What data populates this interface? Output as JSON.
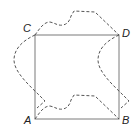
{
  "diagram": {
    "type": "geometry",
    "colors": {
      "square_stroke": "#7a7a7a",
      "dashed_stroke": "#555555",
      "label": "#222222",
      "background": "#ffffff"
    },
    "vertices": {
      "A": {
        "label": "A",
        "x": 35,
        "y": 119
      },
      "B": {
        "label": "B",
        "x": 119,
        "y": 119
      },
      "C": {
        "label": "C",
        "x": 35,
        "y": 35
      },
      "D": {
        "label": "D",
        "x": 119,
        "y": 35
      }
    },
    "labels": [
      {
        "name": "A",
        "text": "A",
        "x": 24,
        "y": 124
      },
      {
        "name": "B",
        "text": "B",
        "x": 122,
        "y": 124
      },
      {
        "name": "C",
        "text": "C",
        "x": 23,
        "y": 32
      },
      {
        "name": "D",
        "text": "D",
        "x": 122,
        "y": 37
      }
    ],
    "curves": {
      "top": "M35,35 C40,28 44,22 50,22 C55,23 58,26 63,25 C68,24 70,20 71,16 L74,11 L95,12 L119,35",
      "bottom": "M35,119 C40,112 44,106 50,106 C55,107 58,110 63,109 C68,108 70,104 71,100 L74,95 L95,96 L119,119",
      "left": "M35,35 C24,40 14,48 14,60 C14,72 30,86 40,96 L45,101 L37,108",
      "right": "M119,35 C108,40 98,48 98,60 C98,72 114,86 124,96 L129,101 L121,108"
    }
  }
}
